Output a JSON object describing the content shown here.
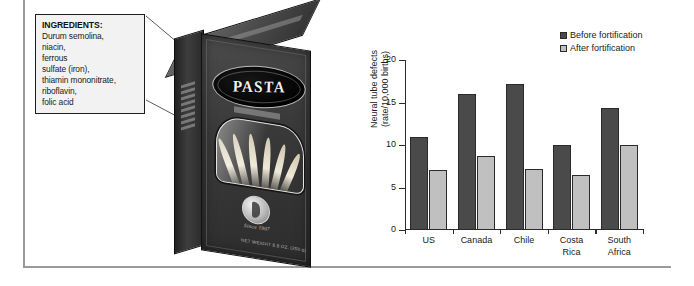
{
  "figure": {
    "panel_left_name": "pasta-box-illustration",
    "panel_right_name": "bar-chart-panel"
  },
  "ingredients_callout": {
    "heading": "INGREDIENTS:",
    "lines": [
      "Durum semolina,",
      "niacin,",
      "ferrous",
      "sulfate (iron),",
      "thiamin mononitrate,",
      "riboflavin,",
      "folic acid"
    ]
  },
  "pasta_box": {
    "brand": "PASTA",
    "seal_text": "Since 1907",
    "net_weight": "NET WEIGHT 8.8 OZ. (250 g)"
  },
  "chart_data": {
    "type": "bar",
    "title": "",
    "xlabel": "",
    "ylabel": "Neural tube defects\n(rate/10,000 births)",
    "ylabel_line1": "Neural tube defects",
    "ylabel_line2": "(rate/10,000 births)",
    "categories": [
      "US",
      "Canada",
      "Chile",
      "Costa Rica",
      "South Africa"
    ],
    "category_lines": [
      [
        "US"
      ],
      [
        "Canada"
      ],
      [
        "Chile"
      ],
      [
        "Costa",
        "Rica"
      ],
      [
        "South",
        "Africa"
      ]
    ],
    "series": [
      {
        "name": "Before fortification",
        "color": "#4a4a4a",
        "values": [
          11.0,
          16.0,
          17.2,
          10.0,
          14.3
        ]
      },
      {
        "name": "After fortification",
        "color": "#c0c0c0",
        "values": [
          7.1,
          8.7,
          7.2,
          6.5,
          10.0
        ]
      }
    ],
    "ylim": [
      0,
      20
    ],
    "yticks": [
      0,
      5,
      10,
      15,
      20
    ],
    "ytick_labels": [
      "0",
      "5",
      "10",
      "15",
      "20"
    ],
    "grid": false,
    "legend_position": "top-right"
  },
  "colors": {
    "before": "#4a4a4a",
    "after": "#c0c0c0",
    "axis": "#2b2b2b",
    "frame": "#9a9a9a"
  }
}
